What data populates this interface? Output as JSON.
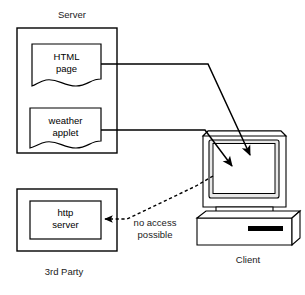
{
  "diagram": {
    "type": "architecture-diagram",
    "title_visible": false,
    "groups": [
      {
        "id": "server",
        "label": "Server",
        "label_position": "above"
      },
      {
        "id": "third_party",
        "label": "3rd Party",
        "label_position": "below"
      },
      {
        "id": "client",
        "label": "Client",
        "label_position": "below"
      }
    ],
    "nodes": [
      {
        "id": "html_page",
        "label_line1": "HTML",
        "label_line2": "page",
        "shape": "document",
        "group": "server"
      },
      {
        "id": "weather_applet",
        "label_line1": "weather",
        "label_line2": "applet",
        "shape": "document",
        "group": "server"
      },
      {
        "id": "http_server",
        "label_line1": "http",
        "label_line2": "server",
        "shape": "rectangle",
        "group": "third_party"
      },
      {
        "id": "client_computer",
        "label": "Client",
        "shape": "computer-illustration",
        "group": "client"
      }
    ],
    "edges": [
      {
        "id": "html-to-client",
        "from": "html_page",
        "to": "client_computer",
        "style": "solid",
        "arrow": "end",
        "label": ""
      },
      {
        "id": "applet-to-client",
        "from": "weather_applet",
        "to": "client_computer",
        "style": "solid",
        "arrow": "end",
        "label": ""
      },
      {
        "id": "client-to-httpserver",
        "from": "client_computer",
        "to": "http_server",
        "style": "dashed",
        "arrow": "end",
        "label_line1": "no access",
        "label_line2": "possible"
      }
    ],
    "labels": {
      "server": "Server",
      "third_party": "3rd Party",
      "client": "Client",
      "html_page_l1": "HTML",
      "html_page_l2": "page",
      "weather_applet_l1": "weather",
      "weather_applet_l2": "applet",
      "http_server_l1": "http",
      "http_server_l2": "server",
      "no_access_l1": "no access",
      "no_access_l2": "possible"
    },
    "colors": {
      "background": "#ffffff",
      "stroke": "#000000",
      "text": "#1a1a1a",
      "screen_bezel": "#e8e8e8"
    }
  }
}
